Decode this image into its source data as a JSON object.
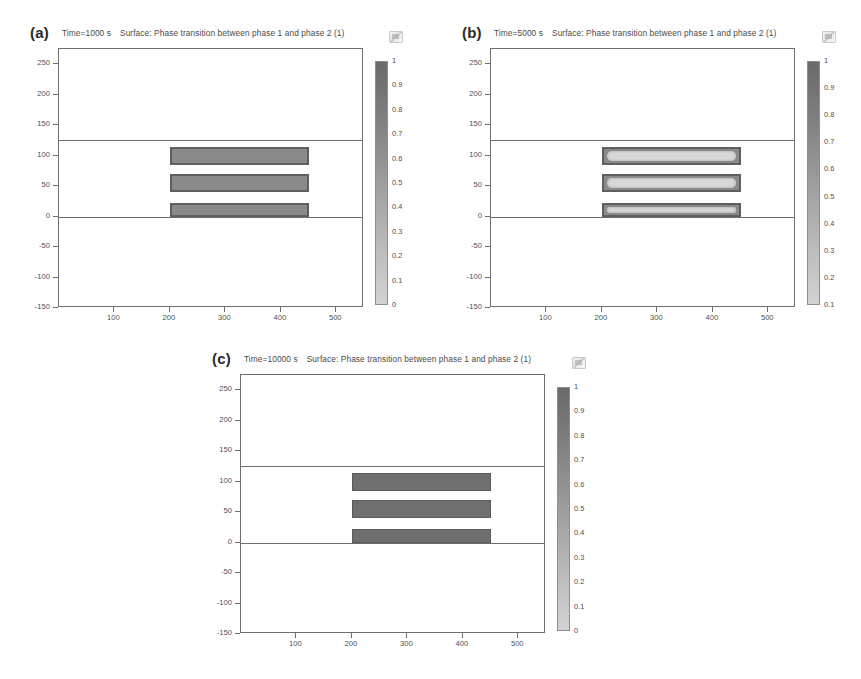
{
  "figure": {
    "background": "#ffffff",
    "kind": "comsol-surface-plots"
  },
  "chart_data": {
    "type": "heatmap",
    "xlabel": "",
    "ylabel": "",
    "xlim": [
      0,
      550
    ],
    "ylim": [
      -150,
      275
    ],
    "xticks": [
      100,
      200,
      300,
      400,
      500
    ],
    "yticks": [
      250,
      200,
      150,
      100,
      50,
      0,
      -50,
      -100,
      -150
    ],
    "grid": false,
    "legend": "colorbar-right",
    "colormap": "grayscale-dark-to-light",
    "interface_lines_y": [
      125,
      0
    ],
    "panels": [
      {
        "letter": "(a)",
        "time_label": "Time=1000 s",
        "surface_label": "Surface: Phase transition between phase 1 and phase 2 (1)",
        "time_value": 1000,
        "time_unit": "s",
        "colorbar": {
          "min": 0,
          "max": 1,
          "ticks": [
            "1",
            "0.9",
            "0.8",
            "0.7",
            "0.6",
            "0.5",
            "0.4",
            "0.3",
            "0.2",
            "0.1",
            "0"
          ]
        },
        "bars": [
          {
            "x0": 200,
            "x1": 450,
            "y0": 85,
            "y1": 115,
            "style": "plain"
          },
          {
            "x0": 200,
            "x1": 450,
            "y0": 40,
            "y1": 70,
            "style": "plain"
          },
          {
            "x0": 200,
            "x1": 450,
            "y0": 0,
            "y1": 22,
            "style": "plain"
          }
        ]
      },
      {
        "letter": "(b)",
        "time_label": "Time=5000 s",
        "surface_label": "Surface: Phase transition between phase 1 and phase 2 (1)",
        "time_value": 5000,
        "time_unit": "s",
        "colorbar": {
          "min": 0.1,
          "max": 1,
          "ticks": [
            "1",
            "0.9",
            "0.8",
            "0.7",
            "0.6",
            "0.5",
            "0.4",
            "0.3",
            "0.2",
            "0.1"
          ]
        },
        "bars": [
          {
            "x0": 200,
            "x1": 450,
            "y0": 85,
            "y1": 115,
            "style": "ring"
          },
          {
            "x0": 200,
            "x1": 450,
            "y0": 40,
            "y1": 70,
            "style": "ring"
          },
          {
            "x0": 200,
            "x1": 450,
            "y0": 0,
            "y1": 22,
            "style": "ring"
          }
        ]
      },
      {
        "letter": "(c)",
        "time_label": "Time=10000 s",
        "surface_label": "Surface: Phase transition between phase 1 and phase 2 (1)",
        "time_value": 10000,
        "time_unit": "s",
        "colorbar": {
          "min": 0,
          "max": 1,
          "ticks": [
            "1",
            "0.9",
            "0.8",
            "0.7",
            "0.6",
            "0.5",
            "0.4",
            "0.3",
            "0.2",
            "0.1",
            "0"
          ]
        },
        "bars": [
          {
            "x0": 200,
            "x1": 450,
            "y0": 85,
            "y1": 115,
            "style": "solid"
          },
          {
            "x0": 200,
            "x1": 450,
            "y0": 40,
            "y1": 70,
            "style": "solid"
          },
          {
            "x0": 200,
            "x1": 450,
            "y0": 0,
            "y1": 22,
            "style": "solid"
          }
        ]
      }
    ]
  }
}
